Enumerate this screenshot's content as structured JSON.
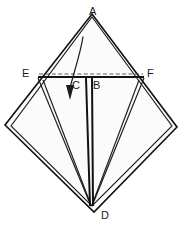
{
  "figure": {
    "background_color": "#ffffff",
    "line_color": "#111111",
    "paper_fill": "#fbfbfb",
    "width": 185,
    "height": 234,
    "vertex_labels": [
      {
        "id": "A",
        "text": "A",
        "x": 89,
        "y": 6
      },
      {
        "id": "E",
        "text": "E",
        "x": 22,
        "y": 68
      },
      {
        "id": "F",
        "text": "F",
        "x": 147,
        "y": 68
      },
      {
        "id": "C",
        "text": "C",
        "x": 72,
        "y": 80
      },
      {
        "id": "B",
        "text": "B",
        "x": 93,
        "y": 80
      },
      {
        "id": "D",
        "text": "D",
        "x": 101,
        "y": 210
      }
    ],
    "geometry": {
      "diamond_outer": "M 92,14 L 177,127 L 94,212 L 5,125 Z",
      "diamond_inner": "M 92,17 L 172,126 L 92,206 L 11,126 Z",
      "horizontal_crease": "M 38,77 L 144,77",
      "dashed_crease": "M 39,74 L 143,74",
      "flap_left_outer": "M 38,78 L 91,206",
      "flap_left_inner": "M 43,80 L 91,205",
      "flap_right_outer": "M 144,78 L 92,206",
      "flap_right_inner": "M 139,80 L 92,205",
      "center_left": "M 86,78 L 90,206",
      "center_right": "M 92,78 L 93,206",
      "notch_left": "M 86,77 L 86,84",
      "notch_right": "M 92,77 L 92,84",
      "arrow_curve": "M 83,37 C 80,55 74,72 70,88",
      "arrow_head": "M 70,100 L 66,85 L 74,85 Z"
    }
  }
}
